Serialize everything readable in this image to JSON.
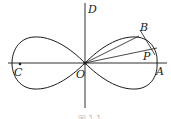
{
  "figure": {
    "type": "lemniscate",
    "labels": {
      "D": "D",
      "B": "B",
      "P": "P",
      "C": "C",
      "O": "O",
      "A": "A"
    },
    "caption": "图 1.1"
  }
}
